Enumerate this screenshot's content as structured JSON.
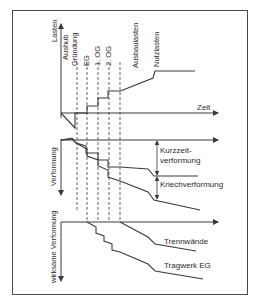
{
  "diagram": {
    "top_panel": {
      "y_axis_label": "Lasten",
      "x_axis_label": "Zeit",
      "phase_labels": [
        "Aushub",
        "Gründung",
        "EG",
        "1. OG",
        "2. OG",
        "Ausbaulasten",
        "Nutzlasten"
      ]
    },
    "middle_panel": {
      "y_axis_label": "Verformung",
      "annotations": [
        "Kurzzeit-",
        "verformung",
        "Kriechverformung"
      ]
    },
    "bottom_panel": {
      "y_axis_label": "wirksame Verformung",
      "curve_labels": [
        "Trennwände",
        "Tragwerk EG"
      ]
    },
    "colors": {
      "line": "#3a3a3a",
      "frame": "#4a4a4a",
      "background": "#ffffff"
    }
  }
}
